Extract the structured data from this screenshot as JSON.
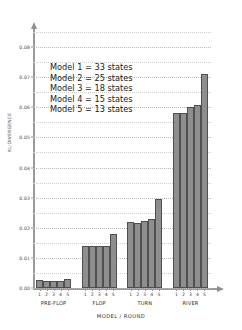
{
  "chart_data": {
    "type": "bar",
    "title": "",
    "xlabel": "MODEL / ROUND",
    "ylabel": "KL-DIVERGENCE",
    "ylim": [
      0.0,
      0.085
    ],
    "grid": true,
    "legend_position": "upper-left-inside",
    "ytick_labels": [
      "0.08",
      "0.07",
      "0.06",
      "0.05",
      "0.04",
      "0.03",
      "0.02",
      "0.01",
      "0.00"
    ],
    "ytick_values": [
      0.08,
      0.07,
      0.06,
      0.05,
      0.04,
      0.03,
      0.02,
      0.01,
      0.0
    ],
    "minor_gridlines": [
      0.075,
      0.065,
      0.055,
      0.045,
      0.035,
      0.025,
      0.015,
      0.005,
      0.085
    ],
    "group_labels": [
      "PRE-FLOP",
      "FLOP",
      "TURN",
      "RIVER"
    ],
    "model_labels": [
      "1",
      "2",
      "3",
      "4",
      "5"
    ],
    "categories": [
      "PRE-FLOP 1",
      "PRE-FLOP 2",
      "PRE-FLOP 3",
      "PRE-FLOP 4",
      "PRE-FLOP 5",
      "FLOP 1",
      "FLOP 2",
      "FLOP 3",
      "FLOP 4",
      "FLOP 5",
      "TURN 1",
      "TURN 2",
      "TURN 3",
      "TURN 4",
      "TURN 5",
      "RIVER 1",
      "RIVER 2",
      "RIVER 3",
      "RIVER 4",
      "RIVER 5"
    ],
    "groups": [
      {
        "name": "PRE-FLOP",
        "values": [
          0.0025,
          0.0024,
          0.0023,
          0.0023,
          0.003
        ]
      },
      {
        "name": "FLOP",
        "values": [
          0.014,
          0.014,
          0.014,
          0.0139,
          0.0178
        ]
      },
      {
        "name": "TURN",
        "values": [
          0.0218,
          0.0216,
          0.0222,
          0.023,
          0.0295
        ]
      },
      {
        "name": "RIVER",
        "values": [
          0.058,
          0.0582,
          0.06,
          0.0608,
          0.0712
        ]
      }
    ],
    "values": [
      0.0025,
      0.0024,
      0.0023,
      0.0023,
      0.003,
      0.014,
      0.014,
      0.014,
      0.0139,
      0.0178,
      0.0218,
      0.0216,
      0.0222,
      0.023,
      0.0295,
      0.058,
      0.0582,
      0.06,
      0.0608,
      0.0712
    ],
    "bar_color": "#8e8e8e",
    "bar_edge_color": "#4f4f4f",
    "annotations": [
      "Model 1 = 33 states",
      "Model 2 = 25 states",
      "Model 3 = 18 states",
      "Model 4 = 15 states",
      "Model 5 = 13 states"
    ]
  },
  "legend": {
    "rows": [
      "Model 1 = 33 states",
      "Model 2 = 25 states",
      "Model 3 = 18 states",
      "Model 4 = 15 states",
      "Model 5 = 13 states"
    ]
  },
  "axes": {
    "x_title": "MODEL / ROUND",
    "y_title": "KL-DIVERGENCE"
  }
}
